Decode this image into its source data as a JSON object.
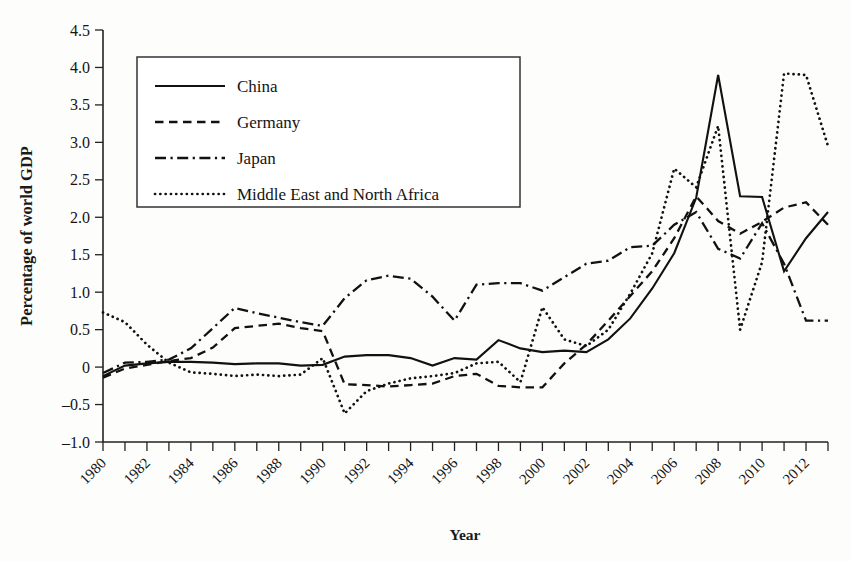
{
  "chart_data": {
    "type": "line",
    "title": "",
    "xlabel": "Year",
    "ylabel": "Percentage of world GDP",
    "xlim": [
      1980,
      2013
    ],
    "ylim": [
      -1.0,
      4.5
    ],
    "grid": false,
    "legend_position": "upper-left-inside",
    "y_ticks": [
      "4.5",
      "4.0",
      "3.5",
      "3.0",
      "2.5",
      "2.0",
      "1.5",
      "1.0",
      "0.5",
      "0",
      "–0.5",
      "–1.0"
    ],
    "y_tick_values": [
      4.5,
      4.0,
      3.5,
      3.0,
      2.5,
      2.0,
      1.5,
      1.0,
      0.5,
      0,
      -0.5,
      -1.0
    ],
    "x_tick_labels": [
      "1980",
      "1982",
      "1984",
      "1986",
      "1988",
      "1990",
      "1992",
      "1994",
      "1996",
      "1998",
      "2000",
      "2002",
      "2004",
      "2006",
      "2008",
      "2010",
      "2012"
    ],
    "x": [
      1980,
      1981,
      1982,
      1983,
      1984,
      1985,
      1986,
      1987,
      1988,
      1989,
      1990,
      1991,
      1992,
      1993,
      1994,
      1995,
      1996,
      1997,
      1998,
      1999,
      2000,
      2001,
      2002,
      2003,
      2004,
      2005,
      2006,
      2007,
      2008,
      2009,
      2010,
      2011,
      2012,
      2013
    ],
    "series": [
      {
        "name": "China",
        "style": "solid",
        "values": [
          -0.12,
          0.02,
          0.05,
          0.07,
          0.07,
          0.06,
          0.04,
          0.05,
          0.05,
          0.02,
          0.03,
          0.14,
          0.16,
          0.16,
          0.12,
          0.02,
          0.12,
          0.1,
          0.36,
          0.25,
          0.2,
          0.22,
          0.2,
          0.37,
          0.65,
          1.05,
          1.52,
          2.26,
          3.9,
          2.28,
          2.27,
          1.28,
          1.72,
          2.07
        ]
      },
      {
        "name": "Germany",
        "style": "dashed",
        "values": [
          -0.14,
          -0.02,
          0.03,
          0.08,
          0.12,
          0.26,
          0.52,
          0.55,
          0.58,
          0.52,
          0.48,
          -0.23,
          -0.24,
          -0.26,
          -0.24,
          -0.22,
          -0.12,
          -0.09,
          -0.25,
          -0.27,
          -0.27,
          0.05,
          0.3,
          0.62,
          0.95,
          1.28,
          1.72,
          2.28,
          1.95,
          1.78,
          1.94,
          2.13,
          2.2,
          1.9
        ]
      },
      {
        "name": "Japan",
        "style": "dash-dot",
        "values": [
          -0.08,
          0.06,
          0.07,
          0.1,
          0.25,
          0.52,
          0.79,
          0.72,
          0.66,
          0.6,
          0.55,
          0.92,
          1.16,
          1.22,
          1.18,
          0.94,
          0.62,
          1.1,
          1.12,
          1.12,
          1.02,
          1.2,
          1.38,
          1.42,
          1.6,
          1.62,
          1.9,
          2.07,
          1.58,
          1.45,
          1.92,
          1.38,
          0.62,
          0.62
        ]
      },
      {
        "name": "Middle East and North Africa",
        "style": "dotted",
        "values": [
          0.73,
          0.6,
          0.3,
          0.06,
          -0.07,
          -0.09,
          -0.12,
          -0.1,
          -0.12,
          -0.1,
          0.12,
          -0.62,
          -0.32,
          -0.22,
          -0.15,
          -0.12,
          -0.08,
          0.05,
          0.07,
          -0.2,
          0.8,
          0.37,
          0.28,
          0.5,
          0.98,
          1.52,
          2.65,
          2.4,
          3.22,
          0.5,
          1.4,
          3.92,
          3.9,
          2.95
        ]
      }
    ]
  },
  "legend": {
    "items": [
      {
        "label": "China",
        "style": "solid"
      },
      {
        "label": "Germany",
        "style": "dashed"
      },
      {
        "label": "Japan",
        "style": "dash-dot"
      },
      {
        "label": "Middle East and North Africa",
        "style": "dotted"
      }
    ]
  },
  "axes": {
    "x_title": "Year",
    "y_title": "Percentage of world GDP"
  }
}
